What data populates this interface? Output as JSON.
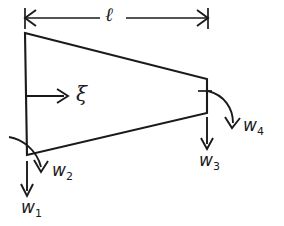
{
  "figure": {
    "type": "engineering-diagram",
    "background_color": "#ffffff",
    "line_color": "#1a1a1a",
    "canvas": {
      "width": 284,
      "height": 226
    }
  },
  "dimension": {
    "name": "length-dimension",
    "label": "ℓ",
    "description": "overall beam length dimension with double-headed arrow",
    "y": 18,
    "x_start": 25,
    "x_end": 208,
    "label_x": 112,
    "label_y": 7
  },
  "beam": {
    "name": "tapered-beam-outline",
    "description": "closed trapezoid, tall at left edge tapering to short right edge",
    "vertices": [
      {
        "name": "top-left",
        "x": 25,
        "y": 33
      },
      {
        "name": "top-right",
        "x": 207,
        "y": 79
      },
      {
        "name": "bottom-right",
        "x": 207,
        "y": 113
      },
      {
        "name": "bottom-left",
        "x": 27,
        "y": 155
      }
    ]
  },
  "loads": [
    {
      "id": "xi",
      "name": "axial-displacement-arrow",
      "label": "ξ",
      "kind": "straight",
      "direction": "right",
      "shaft": {
        "x1": 27,
        "y1": 96,
        "x2": 66,
        "y2": 96
      },
      "label_x": 77,
      "label_y": 85
    },
    {
      "id": "w1",
      "name": "load-w1-arrow",
      "label": "w",
      "subscript": "1",
      "kind": "straight",
      "direction": "down",
      "shaft": {
        "x1": 27,
        "y1": 161,
        "x2": 27,
        "y2": 196
      },
      "label_x": 21,
      "label_y": 200
    },
    {
      "id": "w2",
      "name": "load-w2-moment-arc",
      "label": "w",
      "subscript": "2",
      "kind": "arc",
      "direction": "clockwise-down",
      "label_x": 52,
      "label_y": 163
    },
    {
      "id": "w3",
      "name": "load-w3-arrow",
      "label": "w",
      "subscript": "3",
      "kind": "straight",
      "direction": "down",
      "shaft": {
        "x1": 207,
        "y1": 117,
        "x2": 207,
        "y2": 149
      },
      "label_x": 199,
      "label_y": 153
    },
    {
      "id": "w4",
      "name": "load-w4-moment-arc",
      "label": "w",
      "subscript": "4",
      "kind": "arc",
      "direction": "clockwise-down",
      "label_x": 243,
      "label_y": 118
    }
  ]
}
